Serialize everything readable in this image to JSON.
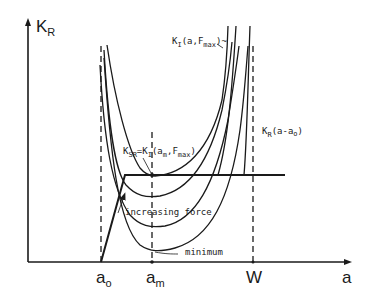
{
  "diagram": {
    "type": "crack resistance curve (R-curve) diagram",
    "y_axis": {
      "label_main": "K",
      "label_sub": "R"
    },
    "x_axis": {
      "label": "a"
    },
    "x_ticks": [
      {
        "main": "a",
        "sub": "o",
        "name": "a0"
      },
      {
        "main": "a",
        "sub": "m",
        "name": "am"
      },
      {
        "main": "W",
        "sub": "",
        "name": "w"
      }
    ],
    "annotations": {
      "ki_fmax": {
        "main": "K",
        "sub": "I",
        "rest": "(a,F",
        "sub2": "max",
        "end": ")~"
      },
      "ksr": {
        "k": "K",
        "sub1": "SR",
        "eq": "=K",
        "sub2": "I",
        "paren": "(a",
        "sub3": "m",
        "comma": ",F",
        "sub4": "max",
        "close": ")"
      },
      "kr_curve": {
        "k": "K",
        "sub": "R",
        "rest": "(a-a",
        "sub2": "o",
        "close": ")"
      },
      "increasing_force": "increasing force",
      "minimum": "minimum"
    },
    "colors": {
      "ink": "#1a1a1a",
      "background": "#ffffff"
    }
  }
}
